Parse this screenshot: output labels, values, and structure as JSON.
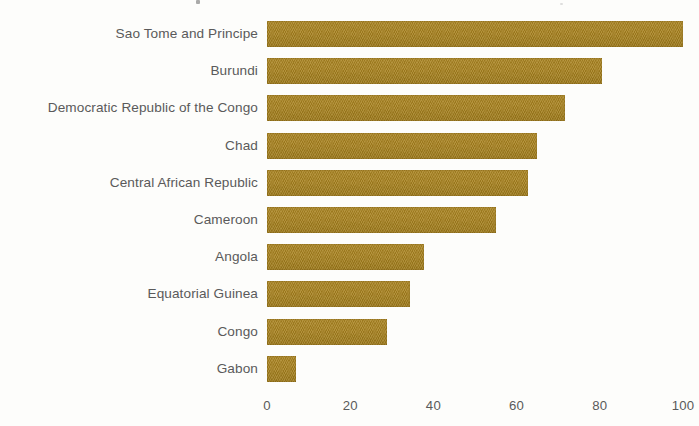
{
  "chart_data": {
    "type": "bar",
    "orientation": "horizontal",
    "title": "",
    "xlabel": "",
    "ylabel": "",
    "xlim": [
      0,
      100
    ],
    "xticks": [
      "0",
      "20",
      "40",
      "60",
      "80",
      "100"
    ],
    "xtick_values": [
      0,
      20,
      40,
      60,
      80,
      100
    ],
    "grid": false,
    "legend": null,
    "bar_color": "#a8821f",
    "label_color": "#5a5a5a",
    "background_color": "#fdfdfb",
    "categories": [
      "Sao Tome and Principe",
      "Burundi",
      "Democratic Republic of the Congo",
      "Chad",
      "Central African Republic",
      "Cameroon",
      "Angola",
      "Equatorial Guinea",
      "Congo",
      "Gabon"
    ],
    "values": [
      100,
      80.5,
      71.6,
      65,
      62.7,
      55,
      37.7,
      34.4,
      28.8,
      7
    ]
  }
}
